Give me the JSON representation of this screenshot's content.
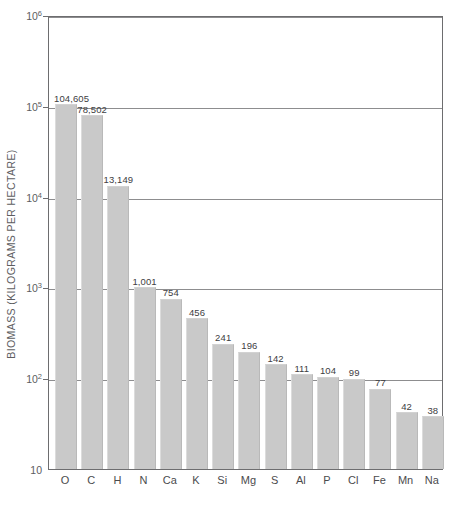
{
  "chart_data": {
    "type": "bar",
    "title": "",
    "xlabel": "",
    "ylabel": "BIOMASS (KILOGRAMS PER HECTARE)",
    "scale": "log",
    "ylim": [
      10,
      1000000
    ],
    "grid": true,
    "legend": "none",
    "categories": [
      "O",
      "C",
      "H",
      "N",
      "Ca",
      "K",
      "Si",
      "Mg",
      "S",
      "Al",
      "P",
      "Cl",
      "Fe",
      "Mn",
      "Na"
    ],
    "values": [
      104605,
      78502,
      13149,
      1001,
      754,
      456,
      241,
      196,
      142,
      111,
      104,
      99,
      77,
      42,
      38
    ],
    "value_labels": [
      "104,605",
      "78,502",
      "13,149",
      "1,001",
      "754",
      "456",
      "241",
      "196",
      "142",
      "111",
      "104",
      "99",
      "77",
      "42",
      "38"
    ],
    "ytick_values": [
      10,
      100,
      1000,
      10000,
      100000,
      1000000
    ],
    "ytick_labels": [
      "10",
      "10²",
      "10³",
      "10⁴",
      "10⁵",
      "10⁶"
    ],
    "ytick_mantissa": [
      "10",
      "10",
      "10",
      "10",
      "10",
      "10"
    ],
    "ytick_exponent": [
      "",
      "2",
      "3",
      "4",
      "5",
      "6"
    ],
    "bar_color": "#c9c9c9",
    "grid_color": "#8d8d8f",
    "axis_color": "#6d6d6f",
    "text_color": "#58585a",
    "background_color": "#ffffff"
  }
}
